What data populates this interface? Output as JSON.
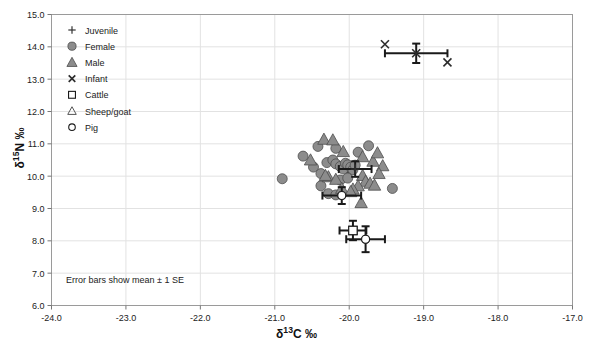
{
  "chart_data": {
    "type": "scatter",
    "title": "",
    "xlabel": "δ¹³C ‰",
    "ylabel": "δ¹⁵N ‰",
    "xlim": [
      -24.0,
      -17.0
    ],
    "ylim": [
      6.0,
      15.0
    ],
    "xticks": [
      "-24.0",
      "-23.0",
      "-22.0",
      "-21.0",
      "-20.0",
      "-19.0",
      "-18.0",
      "-17.0"
    ],
    "yticks": [
      "6.0",
      "7.0",
      "8.0",
      "9.0",
      "10.0",
      "11.0",
      "12.0",
      "13.0",
      "14.0",
      "15.0"
    ],
    "xtick_values": [
      -24.0,
      -23.0,
      -22.0,
      -21.0,
      -20.0,
      -19.0,
      -18.0,
      -17.0
    ],
    "ytick_values": [
      6.0,
      7.0,
      8.0,
      9.0,
      10.0,
      11.0,
      12.0,
      13.0,
      14.0,
      15.0
    ],
    "grid": true,
    "legend_position": "top-left-inside",
    "annotation": "Error bars show mean ± 1 SE",
    "marker_fill": "#8c8c8c",
    "marker_stroke": "#4d4d4d",
    "errorbar_color": "#1a1a1a",
    "grid_color": "#e2e2e2",
    "frame_color": "#9a9a9a",
    "series": [
      {
        "name": "Juvenile",
        "marker": "plus",
        "points": [
          {
            "x": -20.05,
            "y": 10.32
          },
          {
            "x": -19.98,
            "y": 10.12
          }
        ]
      },
      {
        "name": "Female",
        "marker": "filled-circle",
        "points": [
          {
            "x": -20.62,
            "y": 10.62
          },
          {
            "x": -20.48,
            "y": 10.28
          },
          {
            "x": -20.38,
            "y": 10.08
          },
          {
            "x": -20.3,
            "y": 10.42
          },
          {
            "x": -20.22,
            "y": 10.5
          },
          {
            "x": -20.18,
            "y": 10.38
          },
          {
            "x": -20.12,
            "y": 10.3
          },
          {
            "x": -20.08,
            "y": 10.22
          },
          {
            "x": -20.05,
            "y": 10.4
          },
          {
            "x": -20.02,
            "y": 10.35
          },
          {
            "x": -19.98,
            "y": 10.28
          },
          {
            "x": -19.95,
            "y": 10.2
          },
          {
            "x": -19.92,
            "y": 10.34
          },
          {
            "x": -20.42,
            "y": 10.92
          },
          {
            "x": -20.18,
            "y": 10.86
          },
          {
            "x": -19.88,
            "y": 10.74
          },
          {
            "x": -19.74,
            "y": 10.94
          },
          {
            "x": -20.9,
            "y": 9.92
          },
          {
            "x": -20.38,
            "y": 9.7
          },
          {
            "x": -20.28,
            "y": 9.46
          },
          {
            "x": -20.18,
            "y": 9.42
          },
          {
            "x": -20.12,
            "y": 9.88
          },
          {
            "x": -20.02,
            "y": 9.94
          },
          {
            "x": -19.42,
            "y": 9.62
          }
        ]
      },
      {
        "name": "Male",
        "marker": "filled-triangle",
        "points": [
          {
            "x": -20.34,
            "y": 11.14
          },
          {
            "x": -20.22,
            "y": 11.12
          },
          {
            "x": -20.52,
            "y": 10.5
          },
          {
            "x": -20.08,
            "y": 10.76
          },
          {
            "x": -19.82,
            "y": 10.6
          },
          {
            "x": -19.68,
            "y": 10.46
          },
          {
            "x": -19.62,
            "y": 10.72
          },
          {
            "x": -19.55,
            "y": 10.32
          },
          {
            "x": -19.82,
            "y": 10.02
          },
          {
            "x": -19.78,
            "y": 9.84
          },
          {
            "x": -19.72,
            "y": 9.78
          },
          {
            "x": -19.66,
            "y": 9.72
          },
          {
            "x": -19.88,
            "y": 9.7
          },
          {
            "x": -19.95,
            "y": 9.6
          },
          {
            "x": -20.28,
            "y": 9.98
          },
          {
            "x": -20.18,
            "y": 9.9
          },
          {
            "x": -20.1,
            "y": 9.62
          },
          {
            "x": -19.98,
            "y": 9.52
          },
          {
            "x": -19.84,
            "y": 9.18
          },
          {
            "x": -20.32,
            "y": 10.02
          },
          {
            "x": -19.6,
            "y": 10.08
          }
        ]
      },
      {
        "name": "Infant",
        "marker": "cross",
        "points": [
          {
            "x": -19.52,
            "y": 14.08
          },
          {
            "x": -18.68,
            "y": 13.52
          }
        ]
      },
      {
        "name": "Cattle",
        "marker": "open-square",
        "points": [
          {
            "x": -19.95,
            "y": 8.32
          }
        ]
      },
      {
        "name": "Sheep/goat",
        "marker": "open-triangle",
        "points": []
      },
      {
        "name": "Pig",
        "marker": "open-circle",
        "points": [
          {
            "x": -20.1,
            "y": 9.4
          },
          {
            "x": -19.78,
            "y": 8.05
          }
        ]
      }
    ],
    "error_bars": [
      {
        "group": "Infant",
        "marker": "cross",
        "x": -19.1,
        "y": 13.8,
        "x_err": 0.42,
        "y_err": 0.3
      },
      {
        "group": "Adults",
        "marker": "plus",
        "x": -19.92,
        "y": 10.22,
        "x_err": 0.22,
        "y_err": 0.24
      },
      {
        "group": "Pig-mid",
        "marker": "open-circle",
        "x": -20.1,
        "y": 9.4,
        "x_err": 0.26,
        "y_err": 0.26
      },
      {
        "group": "Cattle",
        "marker": "open-square",
        "x": -19.95,
        "y": 8.32,
        "x_err": 0.18,
        "y_err": 0.3
      },
      {
        "group": "Pig",
        "marker": "open-circle",
        "x": -19.78,
        "y": 8.05,
        "x_err": 0.26,
        "y_err": 0.4
      }
    ]
  },
  "legend": {
    "entries": [
      {
        "label": "Juvenile",
        "marker": "plus"
      },
      {
        "label": "Female",
        "marker": "filled-circle"
      },
      {
        "label": "Male",
        "marker": "filled-triangle"
      },
      {
        "label": "Infant",
        "marker": "cross"
      },
      {
        "label": "Cattle",
        "marker": "open-square"
      },
      {
        "label": "Sheep/goat",
        "marker": "open-triangle"
      },
      {
        "label": "Pig",
        "marker": "open-circle"
      }
    ]
  },
  "axes": {
    "x_title_main": "δ",
    "x_title_sup": "13",
    "x_title_tail": "C ‰",
    "y_title_main": "δ",
    "y_title_sup": "15",
    "y_title_tail": "N ‰"
  }
}
